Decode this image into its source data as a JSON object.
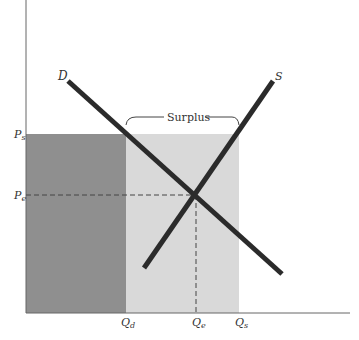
{
  "diagram": {
    "type": "supply-demand",
    "curves": {
      "demand_label": "D",
      "supply_label": "S"
    },
    "annotation": {
      "surplus_label": "Surplus"
    },
    "y_axis_labels": {
      "price_support": "P",
      "price_support_sub": "s",
      "price_equilibrium": "P",
      "price_equilibrium_sub": "e"
    },
    "x_axis_labels": {
      "quantity_demanded": "Q",
      "quantity_demanded_sub": "d",
      "quantity_equilibrium": "Q",
      "quantity_equilibrium_sub": "e",
      "quantity_supplied": "Q",
      "quantity_supplied_sub": "s"
    },
    "colors": {
      "dark_region": "#8f8f8f",
      "light_region": "#d9d9d9",
      "curve": "#2b2b2b",
      "axis": "#555555"
    }
  }
}
